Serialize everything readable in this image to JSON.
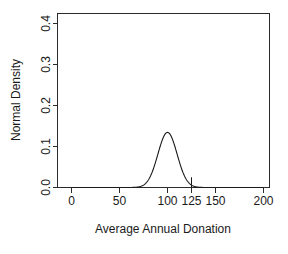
{
  "chart_data": {
    "type": "line",
    "title": "",
    "subtitle": "",
    "xlabel": "Average Annual Donation",
    "ylabel": "Normal Density",
    "xlim": [
      0,
      200
    ],
    "ylim": [
      0,
      0.4
    ],
    "xticks": [
      0,
      50,
      100,
      125,
      150,
      200
    ],
    "xtick_labels": [
      "0",
      "50",
      "100",
      "125",
      "150",
      "200"
    ],
    "yticks": [
      0.0,
      0.1,
      0.2,
      0.3,
      0.4
    ],
    "ytick_labels": [
      "0.0",
      "0.1",
      "0.2",
      "0.3",
      "0.4"
    ],
    "grid": false,
    "legend": "none",
    "series": [
      {
        "name": "Normal Density",
        "distribution": "normal",
        "mean": 100,
        "sd": 10,
        "peak_x": 100,
        "peak_y": 0.4,
        "x": [
          50,
          55,
          60,
          65,
          70,
          72,
          74,
          76,
          78,
          80,
          82,
          84,
          86,
          88,
          90,
          92,
          94,
          96,
          98,
          100,
          102,
          104,
          106,
          108,
          110,
          112,
          114,
          116,
          118,
          120,
          122,
          124,
          126,
          128,
          130,
          135,
          140,
          145,
          150
        ],
        "values": [
          0.0,
          0.0,
          0.0001,
          0.0004,
          0.0018,
          0.0033,
          0.0056,
          0.0091,
          0.014,
          0.0205,
          0.029,
          0.0395,
          0.0519,
          0.0656,
          0.0797,
          0.093,
          0.1043,
          0.1124,
          0.1172,
          0.1187,
          0.1172,
          0.1124,
          0.1043,
          0.093,
          0.0797,
          0.0656,
          0.0519,
          0.0395,
          0.029,
          0.0205,
          0.014,
          0.0091,
          0.0056,
          0.0033,
          0.0018,
          0.0004,
          0.0001,
          0.0,
          0.0
        ]
      }
    ],
    "annotations": [
      {
        "type": "vertical-reference-line",
        "label": "125",
        "x": 125,
        "y_from": 0.0,
        "y_to": 0.025
      }
    ]
  },
  "figure": {
    "background_color": "#ffffff",
    "axis_color": "#2b2b2b",
    "curve_color": "#1a1a1a"
  }
}
